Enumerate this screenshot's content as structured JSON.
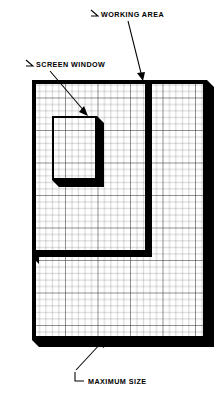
{
  "diagram": {
    "title_implied": "Working Area / Screen Window / Maximum Size",
    "background_color": "#ffffff",
    "ink_color": "#000000",
    "grid_color": "#3a3a3a",
    "labels": [
      {
        "id": "working-area",
        "text": "WORKING   AREA",
        "text_x": 101,
        "text_y": 17,
        "tick_x1": 91,
        "tick_y1": 10,
        "tick_x2": 98,
        "tick_y2": 16,
        "leader_x1": 128,
        "leader_y1": 21,
        "leader_x2": 143,
        "leader_y2": 79,
        "arrow_at": "end"
      },
      {
        "id": "screen-window",
        "text": "SCREEN WINDOW",
        "text_x": 36,
        "text_y": 67,
        "tick_x1": 26,
        "tick_y1": 60,
        "tick_x2": 33,
        "tick_y2": 66,
        "leader_x1": 50,
        "leader_y1": 71,
        "leader_x2": 87,
        "leader_y2": 115,
        "arrow_at": "end"
      },
      {
        "id": "maximum-size",
        "text": "MAXIMUM SIZE",
        "text_x": 86,
        "text_y": 382,
        "tick_x1": 75,
        "tick_y1": 372,
        "tick_x2": 83,
        "tick_y2": 381,
        "leader_x1": 75,
        "leader_y1": 371,
        "leader_x2": 104,
        "leader_y2": 339,
        "arrow_at": "end"
      }
    ],
    "maximum_size_panel": {
      "name": "maximum-size-panel",
      "x": 32,
      "y": 80,
      "width": 175,
      "height": 260,
      "border_thickness": 4,
      "shadow_offset": 7,
      "grid_cell_px": 6.5
    },
    "working_area_panel": {
      "name": "working-area-panel",
      "x": 32,
      "y": 80,
      "width": 120,
      "height": 177,
      "border_thickness": 6,
      "shadow_offset": 6
    },
    "screen_window_panel": {
      "name": "screen-window-panel",
      "x": 52,
      "y": 116,
      "width": 45,
      "height": 64,
      "border_thickness": 2,
      "shadow_offset": 7
    }
  }
}
